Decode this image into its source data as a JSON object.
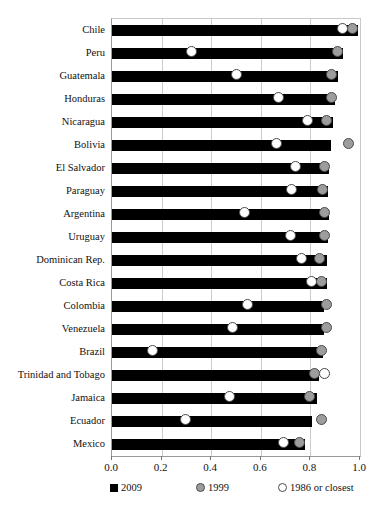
{
  "chart_data": {
    "type": "bar",
    "title": "",
    "xlabel": "",
    "ylabel": "",
    "xlim": [
      0.0,
      1.0
    ],
    "xticks": [
      0.0,
      0.2,
      0.4,
      0.6,
      0.8,
      1.0
    ],
    "xticklabels": [
      "0.0",
      "0.2",
      "0.4",
      "0.6",
      "0.8",
      "1.0"
    ],
    "grid": true,
    "grid_axis": "x",
    "legend_position": "below",
    "orientation": "horizontal",
    "categories": [
      "Chile",
      "Peru",
      "Guatemala",
      "Honduras",
      "Nicaragua",
      "Bolivia",
      "El Salvador",
      "Paraguay",
      "Argentina",
      "Uruguay",
      "Dominican Rep.",
      "Costa Rica",
      "Colombia",
      "Venezuela",
      "Brazil",
      "Trinidad and Tobago",
      "Jamaica",
      "Ecuador",
      "Mexico"
    ],
    "series": [
      {
        "name": "2009",
        "marker": "bar",
        "color": "#000000",
        "values": [
          0.99,
          0.93,
          0.91,
          0.9,
          0.89,
          0.885,
          0.875,
          0.87,
          0.875,
          0.87,
          0.865,
          0.865,
          0.855,
          0.855,
          0.85,
          0.835,
          0.825,
          0.805,
          0.78
        ]
      },
      {
        "name": "1999",
        "marker": "filled-circle",
        "color": "#9d9d9d",
        "values": [
          0.97,
          0.91,
          0.885,
          0.885,
          0.865,
          0.955,
          0.855,
          0.85,
          0.855,
          0.855,
          0.835,
          0.845,
          0.865,
          0.865,
          0.845,
          0.815,
          0.795,
          0.845,
          0.755
        ]
      },
      {
        "name": "1986 or closest",
        "marker": "open-circle",
        "color": "#ffffff",
        "values": [
          0.93,
          0.32,
          0.5,
          0.67,
          0.79,
          0.665,
          0.74,
          0.725,
          0.535,
          0.72,
          0.765,
          0.805,
          0.545,
          0.485,
          0.165,
          0.855,
          0.475,
          0.295,
          0.69
        ]
      }
    ]
  },
  "legend": {
    "items": [
      {
        "label": "2009",
        "swatch": "black-square-icon"
      },
      {
        "label": "1999",
        "swatch": "gray-circle-icon"
      },
      {
        "label": "1986 or closest",
        "swatch": "open-circle-icon"
      }
    ]
  }
}
